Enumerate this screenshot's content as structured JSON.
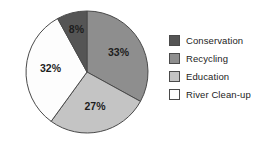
{
  "chart_data": {
    "type": "pie",
    "title": "",
    "categories": [
      "Conservation",
      "Recycling",
      "Education",
      "River Clean-up"
    ],
    "values": [
      8,
      33,
      27,
      32
    ],
    "value_labels": [
      "8%",
      "33%",
      "27%",
      "32%"
    ],
    "unit": "%",
    "colors": [
      "#555555",
      "#8e8e8e",
      "#c4c4c4",
      "#fdfdfd"
    ],
    "start_angle_deg": 0,
    "direction": "clockwise",
    "legend_position": "right",
    "grid": false,
    "slices": [
      {
        "label": "Recycling",
        "value": 33,
        "value_label": "33%",
        "color": "#8e8e8e",
        "start_deg": 0,
        "end_deg": 118.8
      },
      {
        "label": "Education",
        "value": 27,
        "value_label": "27%",
        "color": "#c4c4c4",
        "start_deg": 118.8,
        "end_deg": 216.0
      },
      {
        "label": "River Clean-up",
        "value": 32,
        "value_label": "32%",
        "color": "#fdfdfd",
        "start_deg": 216.0,
        "end_deg": 331.2
      },
      {
        "label": "Conservation",
        "value": 8,
        "value_label": "8%",
        "color": "#555555",
        "start_deg": 331.2,
        "end_deg": 360.0
      }
    ]
  },
  "legend": {
    "items": [
      {
        "label": "Conservation",
        "color": "#555555"
      },
      {
        "label": "Recycling",
        "color": "#8e8e8e"
      },
      {
        "label": "Education",
        "color": "#c4c4c4"
      },
      {
        "label": "River Clean-up",
        "color": "#fdfdfd"
      }
    ]
  },
  "style": {
    "outline_color": "#4a4a4a",
    "background": "#ffffff",
    "label_color": "#1d1d1d"
  }
}
